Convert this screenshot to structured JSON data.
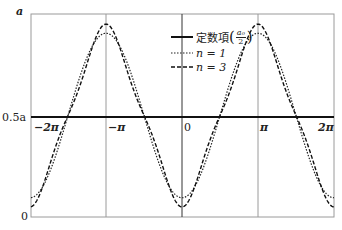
{
  "chart_data": {
    "type": "line",
    "title": "",
    "xlabel": "",
    "ylabel": "a",
    "xlim": [
      -6.6,
      6.9
    ],
    "ylim": [
      0,
      1
    ],
    "grid": "vertical lines at x = -π, 0, π",
    "x_ticks": [
      "-2π",
      "-π",
      "0",
      "π",
      "2π"
    ],
    "y_ticks": [
      "0",
      "0.5a",
      "a"
    ],
    "legend_position": "upper center",
    "series": [
      {
        "name": "定数項(a0/2)",
        "style": "solid-thick",
        "formula": "a/2",
        "y_at_x0": 0.5,
        "y_at_pi": 0.5
      },
      {
        "name": "n=1",
        "style": "dotted",
        "formula": "a/2 - (4a/π²)cos x",
        "y_at_x0": 0.095,
        "y_at_pi": 0.905
      },
      {
        "name": "n=3",
        "style": "dashed",
        "formula": "a/2 - (4a/π²)(cos x + cos3x/9)",
        "y_at_x0": 0.05,
        "y_at_pi": 0.95
      }
    ]
  },
  "axis": {
    "y_top": "a",
    "y_mid": "0.5a",
    "y_bottom": "0",
    "x_m2pi": "−2π",
    "x_mpi": "−π",
    "x_0": "0",
    "x_pi": "π",
    "x_2pi": "2π"
  },
  "legend": {
    "const_label": "定数項",
    "const_num": "a₀",
    "const_den": "2",
    "n1_label": "n = 1",
    "n3_label": "n = 3"
  }
}
